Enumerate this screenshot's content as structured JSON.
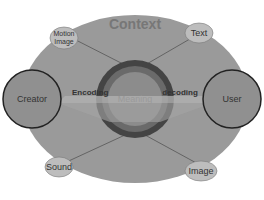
{
  "diagram": {
    "title": "Context",
    "center": "Meaning",
    "left_arrow": "Encoding",
    "right_arrow": "decoding",
    "nodes": {
      "creator": "Creator",
      "user": "User",
      "motion_image": "Motion Image",
      "text": "Text",
      "sound": "Sound",
      "image": "Image"
    }
  },
  "colors": {
    "outer": "#9a9a9a",
    "ring_dark": "#444444",
    "ring_mid": "#6a6a6a",
    "center": "#8c8c8c",
    "small_node": "#bdbdbd"
  }
}
